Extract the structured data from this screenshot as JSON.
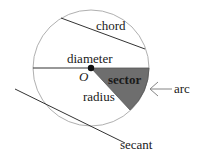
{
  "diagram": {
    "labels": {
      "chord": "chord",
      "diameter": "diameter",
      "center": "O",
      "sector": "sector",
      "radius": "radius",
      "arc": "arc",
      "secant": "secant"
    },
    "colors": {
      "circle_stroke": "#b0b0b0",
      "line_stroke": "#333333",
      "sector_fill": "#6e6e6e",
      "center_dot": "#111111",
      "text": "#1a1a1a"
    },
    "geometry": {
      "center": [
        91,
        68
      ],
      "radius": 58,
      "chord": [
        [
          61,
          18
        ],
        [
          145,
          49
        ]
      ],
      "diameter": [
        [
          33,
          68
        ],
        [
          149,
          68
        ]
      ],
      "sector_arc_end": [
        130,
        108
      ],
      "secant": [
        [
          15,
          89
        ],
        [
          125,
          143
        ]
      ],
      "arc_arrow": [
        [
          172,
          89
        ],
        [
          151,
          89
        ]
      ]
    }
  }
}
